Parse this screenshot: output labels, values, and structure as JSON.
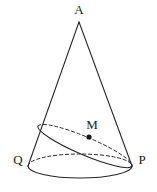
{
  "figure": {
    "kind": "geometry-diagram",
    "background_color": "#ffffff",
    "stroke_color": "#242424",
    "dash_color": "#2b2b2b",
    "label_color": "#1a1a1a",
    "canvas": {
      "width": 157,
      "height": 192
    }
  },
  "labels": {
    "apex": "A",
    "midpoint": "M",
    "base_left": "Q",
    "base_right": "P"
  },
  "points": {
    "apex": {
      "name": "A",
      "x": 79,
      "y": 22
    },
    "midpoint": {
      "name": "M",
      "x": 89,
      "y": 137
    },
    "base_left": {
      "name": "Q",
      "x": 28,
      "y": 166
    },
    "base_right": {
      "name": "P",
      "x": 132,
      "y": 166
    },
    "section_left": {
      "name": "",
      "x": 38,
      "y": 126
    }
  },
  "label_positions": {
    "apex": {
      "x": 79,
      "y": 11
    },
    "midpoint": {
      "x": 92,
      "y": 126
    },
    "base_left": {
      "x": 18,
      "y": 161
    },
    "base_right": {
      "x": 142,
      "y": 161
    }
  },
  "geometry": {
    "base_ellipse": {
      "cx": 80,
      "cy": 166,
      "rx": 52,
      "ry": 12,
      "front_arc": "solid",
      "back_arc": "dashed"
    },
    "section_ellipse": {
      "cx": 85,
      "cy": 146,
      "rx": 51,
      "ry": 9,
      "rotation_deg": 23,
      "near_arc": "solid",
      "far_arc": "dashed"
    },
    "slant_left": {
      "x1": 79,
      "y1": 22,
      "x2": 28,
      "y2": 166,
      "style": "solid"
    },
    "slant_right": {
      "x1": 79,
      "y1": 22,
      "x2": 132,
      "y2": 166,
      "style": "solid"
    }
  }
}
